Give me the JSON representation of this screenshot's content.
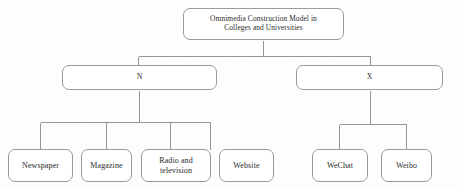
{
  "diagram": {
    "type": "tree",
    "title_text": "Omnimedia Construction Model in Colleges and Universities",
    "style": {
      "line_color": "#8a8a8a",
      "box_border_color": "#9a9a9a",
      "box_fill_color": "#ffffff",
      "text_color": "#2b2b2b",
      "background_color": "#fdfdfb"
    },
    "nodes": {
      "root": {
        "label": "Omnimedia Construction Model in\nColleges and Universities",
        "level": 1
      },
      "branch_n": {
        "label": "N",
        "level": 2
      },
      "branch_x": {
        "label": "X",
        "level": 2
      },
      "leaves_n": [
        {
          "label": "Newspaper"
        },
        {
          "label": "Magazine"
        },
        {
          "label": "Radio and\ntelevision"
        },
        {
          "label": "Website"
        }
      ],
      "leaves_x": [
        {
          "label": "WeChat"
        },
        {
          "label": "Weibo"
        }
      ]
    }
  }
}
